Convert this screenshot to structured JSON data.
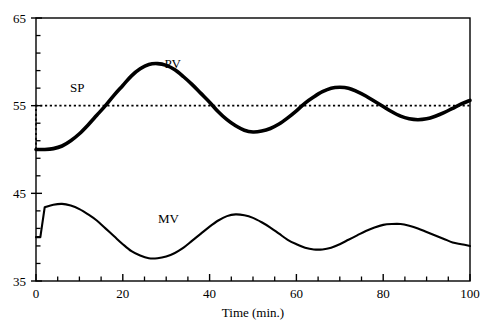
{
  "chart_data": {
    "type": "line",
    "title": "",
    "subtitle": "",
    "xlabel": "Time (min.)",
    "ylabel": "",
    "xlim": [
      0,
      100
    ],
    "ylim": [
      35,
      65
    ],
    "xticks": [
      0,
      20,
      40,
      60,
      80,
      100
    ],
    "xtick_labels": [
      "0",
      "20",
      "40",
      "60",
      "80",
      "100"
    ],
    "xminor_step": 5,
    "yticks": [
      35,
      45,
      55,
      65
    ],
    "ytick_labels": [
      "35",
      "45",
      "55",
      "65"
    ],
    "yminor_step": 2,
    "grid": false,
    "legend_position": "inline-annotations",
    "series": [
      {
        "name": "SP",
        "label": "SP",
        "style": "dotted",
        "color": "#000000",
        "annotation": {
          "text": "SP",
          "x": 9.5,
          "y": 56.6
        },
        "x": [
          0,
          0,
          100
        ],
        "values": [
          50,
          55,
          55
        ]
      },
      {
        "name": "PV",
        "label": "PV",
        "style": "solid-thick",
        "color": "#000000",
        "annotation": {
          "text": "PV",
          "x": 31.5,
          "y": 59.3
        },
        "x": [
          0,
          2,
          4,
          6,
          8,
          10,
          12,
          14,
          16,
          18,
          20,
          22,
          24,
          26,
          28,
          30,
          32,
          34,
          36,
          38,
          40,
          42,
          44,
          46,
          48,
          50,
          52,
          54,
          56,
          58,
          60,
          62,
          64,
          66,
          68,
          70,
          72,
          74,
          76,
          78,
          80,
          82,
          84,
          86,
          88,
          90,
          92,
          94,
          96,
          98,
          100
        ],
        "values": [
          50.0,
          50.0,
          50.1,
          50.4,
          51.0,
          51.8,
          52.8,
          53.9,
          55.0,
          56.2,
          57.3,
          58.4,
          59.2,
          59.7,
          59.8,
          59.6,
          59.1,
          58.3,
          57.4,
          56.4,
          55.4,
          54.3,
          53.4,
          52.7,
          52.2,
          52.0,
          52.1,
          52.4,
          52.9,
          53.6,
          54.4,
          55.3,
          56.0,
          56.6,
          57.0,
          57.1,
          57.0,
          56.6,
          56.1,
          55.5,
          54.9,
          54.3,
          53.8,
          53.5,
          53.4,
          53.5,
          53.8,
          54.2,
          54.7,
          55.2,
          55.6
        ]
      },
      {
        "name": "MV",
        "label": "MV",
        "style": "solid",
        "color": "#000000",
        "annotation": {
          "text": "MV",
          "x": 30.5,
          "y": 41.6
        },
        "x": [
          0,
          1,
          2,
          4,
          6,
          8,
          10,
          12,
          14,
          16,
          18,
          20,
          22,
          24,
          26,
          28,
          30,
          32,
          34,
          36,
          38,
          40,
          42,
          44,
          46,
          48,
          50,
          52,
          54,
          56,
          58,
          60,
          62,
          64,
          66,
          68,
          70,
          72,
          74,
          76,
          78,
          80,
          82,
          84,
          86,
          88,
          90,
          92,
          94,
          96,
          98,
          100
        ],
        "values": [
          40.0,
          40.0,
          43.4,
          43.7,
          43.8,
          43.6,
          43.2,
          42.6,
          41.9,
          41.0,
          40.1,
          39.2,
          38.4,
          37.9,
          37.6,
          37.6,
          37.8,
          38.2,
          38.8,
          39.6,
          40.4,
          41.2,
          41.9,
          42.4,
          42.6,
          42.5,
          42.2,
          41.7,
          41.1,
          40.4,
          39.7,
          39.2,
          38.8,
          38.6,
          38.6,
          38.8,
          39.2,
          39.7,
          40.2,
          40.7,
          41.1,
          41.4,
          41.5,
          41.5,
          41.3,
          41.0,
          40.6,
          40.2,
          39.8,
          39.4,
          39.2,
          39.0
        ]
      }
    ]
  },
  "axes": {
    "x_axis_title": "Time (min.)",
    "y_axis_title": ""
  }
}
